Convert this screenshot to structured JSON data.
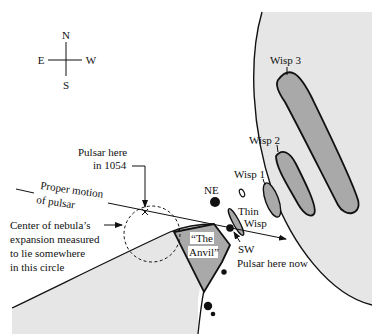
{
  "compass": {
    "north": "N",
    "south": "S",
    "east": "E",
    "west": "W"
  },
  "labels": {
    "wisp3": "Wisp 3",
    "wisp2": "Wisp 2",
    "wisp1": "Wisp 1",
    "ne": "NE",
    "sw": "SW",
    "thin_wisp_line1": "Thin",
    "thin_wisp_line2": "Wisp",
    "anvil_line1": "“The",
    "anvil_line2": "Anvil”",
    "pulsar_now": "Pulsar here now",
    "pulsar_1054_line1": "Pulsar here",
    "pulsar_1054_line2": "in 1054",
    "proper_motion_line1": "Proper motion",
    "proper_motion_line2": "of pulsar",
    "center_line1": "Center of nebula’s",
    "center_line2": "expansion measured",
    "center_line3": "to lie somewhere",
    "center_line4": "in this circle"
  },
  "colors": {
    "nebula_fill": "#e6e6e6",
    "wisp_fill": "#a9a9a9",
    "line": "#111111"
  }
}
